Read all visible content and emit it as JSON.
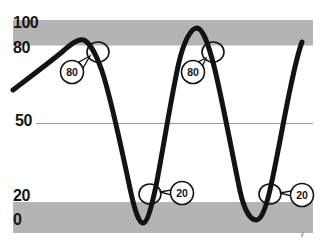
{
  "figure": {
    "width": 329,
    "height": 249,
    "background": "#ffffff"
  },
  "colors": {
    "band": "#b4b4b4",
    "curve": "#131313",
    "midline": "#9a9a9a",
    "annotation_stroke": "#131313",
    "callout_fill": "#ffffff",
    "text": "#151515",
    "artifact": "#8a8a8a"
  },
  "chart_data": {
    "type": "line",
    "ylim": [
      0,
      100
    ],
    "yticks": [
      0,
      20,
      50,
      80,
      100
    ],
    "ytick_labels": [
      "0",
      "20",
      "50",
      "80",
      "100"
    ],
    "midline_value": 50,
    "grid": "single horizontal reference line at 50",
    "legend": "none",
    "bands": [
      {
        "name": "overbought",
        "range": [
          80,
          100
        ],
        "fill": "#b4b4b4"
      },
      {
        "name": "oversold",
        "range": [
          0,
          20
        ],
        "fill": "#b4b4b4"
      }
    ],
    "series": [
      {
        "name": "oscillator",
        "x_percent": [
          0,
          6,
          13,
          22,
          28,
          32,
          43,
          46,
          50,
          61,
          67,
          71,
          81,
          86,
          91,
          95,
          96
        ],
        "values": [
          63,
          71,
          79,
          85,
          80,
          50,
          6,
          20,
          50,
          94,
          80,
          50,
          8,
          20,
          50,
          80,
          82
        ]
      }
    ],
    "annotations": [
      {
        "label": "80",
        "value": 80,
        "at_x_percent": 28,
        "direction": "falling",
        "marker": "circle-on-curve"
      },
      {
        "label": "80",
        "value": 80,
        "at_x_percent": 67,
        "direction": "falling",
        "marker": "circle-on-curve"
      },
      {
        "label": "20",
        "value": 20,
        "at_x_percent": 46,
        "direction": "rising",
        "marker": "circle-on-curve"
      },
      {
        "label": "20",
        "value": 20,
        "at_x_percent": 86,
        "direction": "rising",
        "marker": "circle-on-curve"
      }
    ]
  },
  "geometry": {
    "bands": [
      {
        "x": 13,
        "y": 20,
        "w": 300,
        "h": 25.5
      },
      {
        "x": 13,
        "y": 202,
        "w": 300,
        "h": 31
      }
    ],
    "midline": {
      "x1": 36,
      "y1": 123.5,
      "x2": 313,
      "y2": 123.5
    },
    "curve_path": "M 13 90 C 30 77, 50 62, 62 52 C 70 45, 78 38, 84 40 C 91 44, 96 54, 102 71 C 112 101, 124 161, 131 193 C 135 211, 139 223, 143 223 C 147 223, 151 209, 156 186 C 162 156, 172 92, 179 62 C 184 41, 191 28, 197 28 C 203 29, 208 43, 214 66 C 222 98, 233 158, 240 191 C 244 209, 250 220, 256 220 C 261 220, 265 210, 269 194 C 275 170, 284 117, 291 85 C 295 66, 299 50, 302 42",
    "curve_width": 5,
    "markers": [
      {
        "cx": 98,
        "cy": 52,
        "rx": 11,
        "ry": 10
      },
      {
        "cx": 213,
        "cy": 52,
        "rx": 11,
        "ry": 10
      },
      {
        "cx": 150,
        "cy": 194,
        "rx": 11,
        "ry": 10
      },
      {
        "cx": 270,
        "cy": 194,
        "rx": 11,
        "ry": 10
      }
    ],
    "callouts": [
      {
        "cx": 72,
        "cy": 72,
        "r": 11.5,
        "label": "80",
        "tail": "90,56 79,62 83,68"
      },
      {
        "cx": 193,
        "cy": 72,
        "r": 11.5,
        "label": "80",
        "tail": "206,58 198,62 202,67"
      },
      {
        "cx": 182,
        "cy": 193,
        "r": 11.5,
        "label": "20",
        "tail": "160,192 171,190 171,195"
      },
      {
        "cx": 302,
        "cy": 195,
        "r": 11.5,
        "label": "20",
        "tail": "280,193 291,191 291,196"
      }
    ],
    "ticks": [
      {
        "label": "100",
        "x": 13,
        "y": 27.5
      },
      {
        "label": "80",
        "x": 13,
        "y": 53
      },
      {
        "label": "50",
        "x": 15,
        "y": 126
      },
      {
        "label": "20",
        "x": 13,
        "y": 201
      },
      {
        "label": "0",
        "x": 13,
        "y": 225
      }
    ],
    "artifact": {
      "x": 302,
      "y": 232,
      "w": 2,
      "h": 5
    }
  }
}
